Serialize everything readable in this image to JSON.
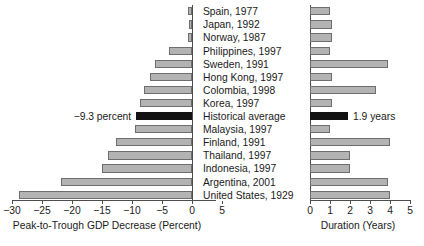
{
  "chart_data": {
    "type": "bar",
    "title": "",
    "subtitle": "",
    "orientation": "horizontal",
    "panels": [
      {
        "name": "gdp-decrease",
        "xlabel": "Peak-to-Trough GDP Decrease (Percent)",
        "xlim": [
          -30,
          5
        ],
        "ticks": [
          -30,
          -25,
          -20,
          -15,
          -10,
          -5,
          0,
          5
        ],
        "tick_labels": [
          "−30",
          "−25",
          "−20",
          "−15",
          "−10",
          "−5",
          "0",
          "5"
        ],
        "grid": false,
        "annotation": "−9.3 percent"
      },
      {
        "name": "duration",
        "xlabel": "Duration (Years)",
        "xlim": [
          0,
          5
        ],
        "ticks": [
          0,
          1,
          2,
          3,
          4,
          5
        ],
        "tick_labels": [
          "0",
          "1",
          "2",
          "3",
          "4",
          "5"
        ],
        "grid": false,
        "annotation": "1.9 years"
      }
    ],
    "categories": [
      "Spain, 1977",
      "Japan, 1992",
      "Norway, 1987",
      "Philippines, 1997",
      "Sweden, 1991",
      "Hong Kong, 1997",
      "Colombia, 1998",
      "Korea, 1997",
      "Historical average",
      "Malaysia, 1997",
      "Finland, 1991",
      "Thailand, 1997",
      "Indonesia, 1997",
      "Argentina, 2001",
      "United States, 1929"
    ],
    "series": [
      {
        "name": "Peak-to-Trough GDP Decrease (Percent)",
        "panel": "gdp-decrease",
        "values": [
          -0.6,
          -0.5,
          -0.7,
          -3.9,
          -6.2,
          -7.0,
          -8.0,
          -8.6,
          -9.3,
          -9.5,
          -12.6,
          -14.0,
          -15.0,
          -21.9,
          -28.9
        ]
      },
      {
        "name": "Duration (Years)",
        "panel": "duration",
        "values": [
          1.0,
          1.1,
          1.1,
          1.0,
          3.9,
          1.1,
          3.3,
          1.1,
          1.9,
          1.0,
          4.0,
          2.0,
          2.0,
          3.9,
          4.0
        ]
      }
    ],
    "highlight_category": "Historical average",
    "colors": {
      "bar_fill": "#b3b3b3",
      "bar_stroke": "#6e6e6e",
      "highlight_fill": "#121212",
      "axis": "#4d4d4d",
      "text": "#1a1a1a",
      "background": "#ffffff"
    }
  }
}
